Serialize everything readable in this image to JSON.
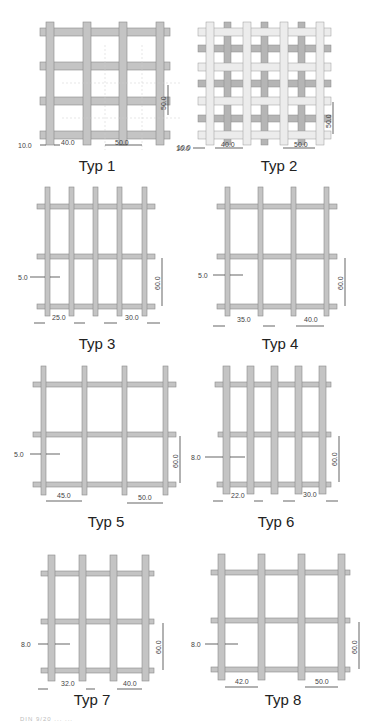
{
  "panels": [
    {
      "id": "typ1",
      "caption": "Typ 1",
      "dims": {
        "edge": "10.0",
        "gap": "40.0",
        "pitch": "50.0",
        "vpitch": "50.0",
        "edge_right": "10.0"
      }
    },
    {
      "id": "typ2",
      "caption": "Typ 2",
      "dims": {
        "edge": "10.0",
        "gap": "40.0",
        "pitch": "50.0",
        "vpitch": "50.0"
      }
    },
    {
      "id": "typ3",
      "caption": "Typ 3",
      "dims": {
        "wire": "5.0",
        "gap": "25.0",
        "pitch": "30.0",
        "vpitch": "60.0"
      }
    },
    {
      "id": "typ4",
      "caption": "Typ 4",
      "dims": {
        "wire": "5.0",
        "gap": "35.0",
        "pitch": "40.0",
        "vpitch": "60.0"
      }
    },
    {
      "id": "typ5",
      "caption": "Typ 5",
      "dims": {
        "wire": "5.0",
        "gap": "45.0",
        "pitch": "50.0",
        "vpitch": "60.0"
      }
    },
    {
      "id": "typ6",
      "caption": "Typ 6",
      "dims": {
        "wire": "8.0",
        "gap": "22.0",
        "pitch": "30.0",
        "vpitch": "60.0"
      }
    },
    {
      "id": "typ7",
      "caption": "Typ 7",
      "dims": {
        "wire": "8.0",
        "gap": "32.0",
        "pitch": "40.0",
        "vpitch": "60.0"
      }
    },
    {
      "id": "typ8",
      "caption": "Typ 8",
      "dims": {
        "wire": "8.0",
        "gap": "42.0",
        "pitch": "50.0",
        "vpitch": "60.0"
      }
    }
  ],
  "footer": "DIN 9/20 ... ...",
  "colors": {
    "bar": "#bdbdbd",
    "bar_edge": "#8a8a8a",
    "bar_light": "#e6e6e6",
    "text": "#222222"
  }
}
